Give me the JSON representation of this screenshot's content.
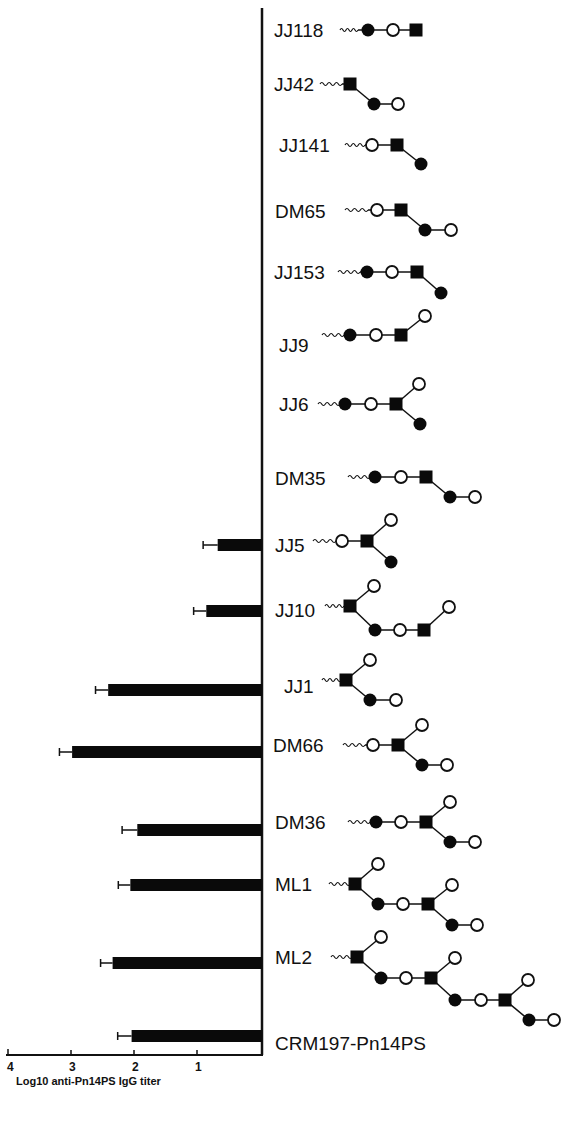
{
  "chart_data": {
    "type": "bar",
    "orientation": "horizontal",
    "title": "",
    "xlabel": "Log10 anti-Pn14PS IgG titer",
    "ylabel": "",
    "xlim": [
      4,
      0
    ],
    "x_ticks": [
      "4",
      "3",
      "2",
      "1"
    ],
    "grid": false,
    "legend": null,
    "categories": [
      "JJ118",
      "JJ42",
      "JJ141",
      "DM65",
      "JJ153",
      "JJ9",
      "JJ6",
      "DM35",
      "JJ5",
      "JJ10",
      "JJ1",
      "DM66",
      "DM36",
      "ML1",
      "ML2",
      "CRM197-Pn14PS"
    ],
    "values": [
      0,
      0,
      0,
      0,
      0,
      0,
      0,
      0,
      0.7,
      0.88,
      2.43,
      3.0,
      1.97,
      2.08,
      2.36,
      2.06
    ],
    "error_upper": [
      0,
      0,
      0,
      0,
      0,
      0,
      0,
      0,
      0.93,
      1.08,
      2.63,
      3.2,
      2.21,
      2.27,
      2.55,
      2.28
    ],
    "annotations": "Each category is drawn with a glycan structure schematic: filled circles, open circles, filled squares, with a wavy linker"
  },
  "axis": {
    "title": "Log10 anti-Pn14PS IgG titer",
    "ticks": [
      {
        "label": "4",
        "x": 10
      },
      {
        "label": "3",
        "x": 72
      },
      {
        "label": "2",
        "x": 135
      },
      {
        "label": "1",
        "x": 198
      }
    ]
  },
  "rows": [
    {
      "label": "JJ118",
      "lx": 274,
      "ly": 37
    },
    {
      "label": "JJ42",
      "lx": 274,
      "ly": 91
    },
    {
      "label": "JJ141",
      "lx": 279,
      "ly": 152
    },
    {
      "label": "DM65",
      "lx": 275,
      "ly": 218
    },
    {
      "label": "JJ153",
      "lx": 274,
      "ly": 279
    },
    {
      "label": "JJ9",
      "lx": 279,
      "ly": 352
    },
    {
      "label": "JJ6",
      "lx": 279,
      "ly": 411
    },
    {
      "label": "DM35",
      "lx": 275,
      "ly": 485
    },
    {
      "label": "JJ5",
      "lx": 275,
      "ly": 552
    },
    {
      "label": "JJ10",
      "lx": 275,
      "ly": 617
    },
    {
      "label": "JJ1",
      "lx": 284,
      "ly": 693
    },
    {
      "label": "DM66",
      "lx": 273,
      "ly": 752
    },
    {
      "label": "DM36",
      "lx": 275,
      "ly": 829
    },
    {
      "label": "ML1",
      "lx": 275,
      "ly": 891
    },
    {
      "label": "ML2",
      "lx": 275,
      "ly": 964
    },
    {
      "label": "CRM197-Pn14PS",
      "lx": 275,
      "ly": 1050
    }
  ]
}
